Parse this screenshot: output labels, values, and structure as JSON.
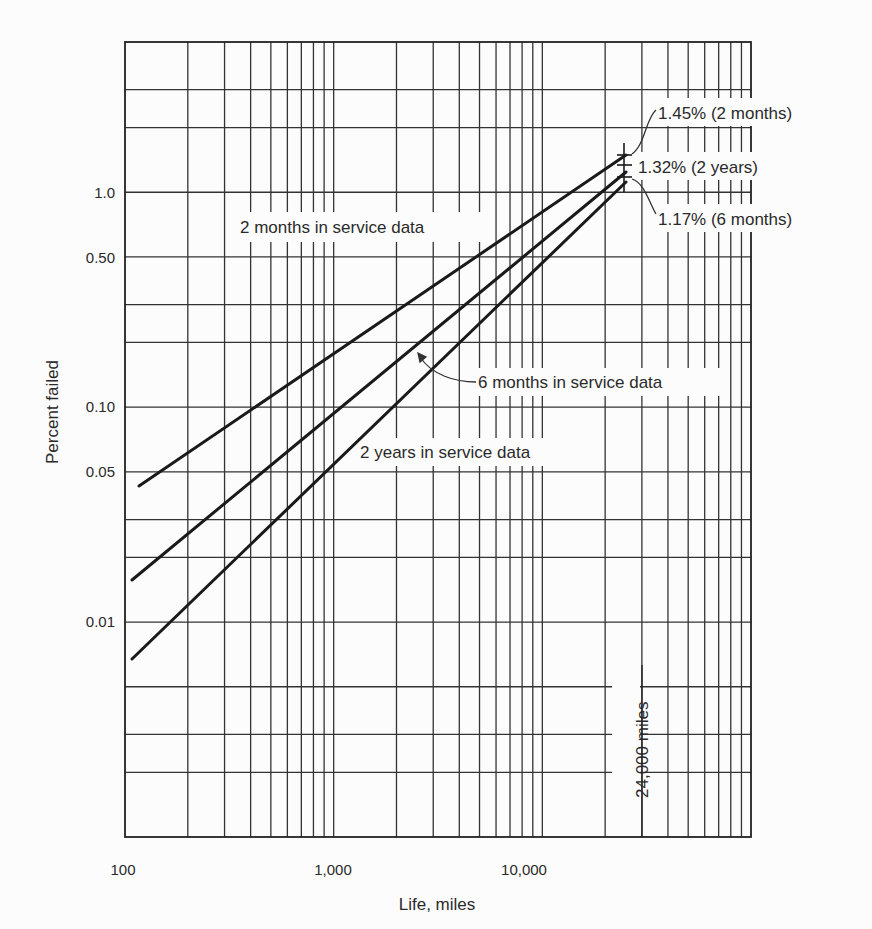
{
  "chart_data": {
    "type": "line",
    "title": "",
    "xlabel": "Life, miles",
    "ylabel": "Percent failed",
    "xscale": "log",
    "yscale": "log",
    "xlim": [
      100,
      100000
    ],
    "ylim": [
      0.001,
      5
    ],
    "grid": true,
    "x_ticks": [
      {
        "value": 100,
        "label": "100"
      },
      {
        "value": 1000,
        "label": "1,000"
      },
      {
        "value": 10000,
        "label": "10,000"
      }
    ],
    "y_ticks": [
      {
        "value": 1.0,
        "label": "1.0"
      },
      {
        "value": 0.5,
        "label": "0.50"
      },
      {
        "value": 0.1,
        "label": "0.10"
      },
      {
        "value": 0.05,
        "label": "0.05"
      },
      {
        "value": 0.01,
        "label": "0.01"
      }
    ],
    "series": [
      {
        "name": "2 months in service data",
        "x": [
          115,
          24000
        ],
        "y": [
          0.043,
          1.45
        ]
      },
      {
        "name": "6 months in service data",
        "x": [
          105,
          24000
        ],
        "y": [
          0.016,
          1.17
        ]
      },
      {
        "name": "2 years in service data",
        "x": [
          105,
          24000
        ],
        "y": [
          0.0068,
          1.32
        ]
      }
    ],
    "annotations": [
      {
        "text": "1.45% (2 months)",
        "x": 24000,
        "y": 1.45
      },
      {
        "text": "1.32% (2 years)",
        "x": 24000,
        "y": 1.32
      },
      {
        "text": "1.17% (6 months)",
        "x": 24000,
        "y": 1.17
      },
      {
        "text": "24,000 miles",
        "x": 24000,
        "orientation": "vertical"
      }
    ],
    "series_labels": {
      "two_months": "2 months in service data",
      "six_months": "6 months in service data",
      "two_years": "2 years in service data"
    }
  }
}
